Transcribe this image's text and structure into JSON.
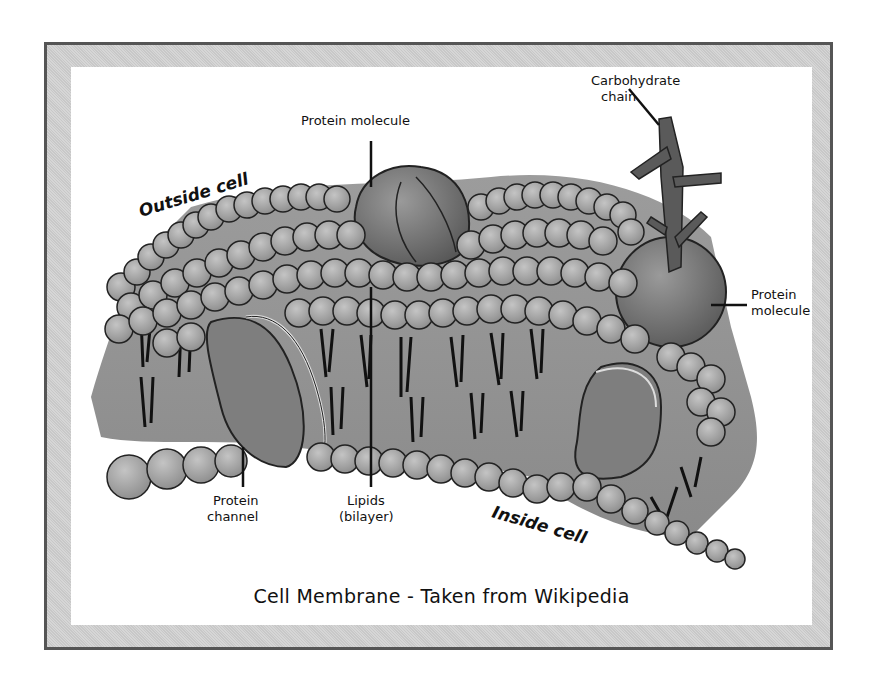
{
  "figure": {
    "caption": "Cell Membrane - Taken from Wikipedia",
    "colors": {
      "frame_border": "#555555",
      "frame_fill": "#cfcfcf",
      "panel": "#ffffff",
      "lipid_head": "#a8a8a8",
      "membrane_body": "#8e8e8e",
      "protein": "#7a7a7a",
      "carbohydrate": "#5a5a5a"
    }
  },
  "labels": {
    "outside_cell": "Outside cell",
    "inside_cell": "Inside cell",
    "protein_molecule_top": "Protein molecule",
    "carbohydrate_line1": "Carbohydrate",
    "carbohydrate_line2": "chain",
    "protein_molecule_right_line1": "Protein",
    "protein_molecule_right_line2": "molecule",
    "protein_channel_line1": "Protein",
    "protein_channel_line2": "channel",
    "lipids_line1": "Lipids",
    "lipids_line2": "(bilayer)"
  }
}
